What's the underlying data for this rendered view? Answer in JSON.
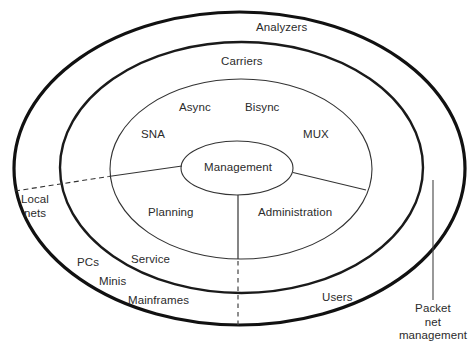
{
  "diagram": {
    "colors": {
      "stroke_outer": "#111111",
      "stroke_inner": "#333333",
      "text": "#2b2b2b",
      "background": "#ffffff"
    },
    "rings": [
      {
        "name": "outer-ring",
        "label": "Analyzers"
      },
      {
        "name": "middle-ring",
        "label": "Carriers"
      },
      {
        "name": "inner-ring",
        "label": ""
      },
      {
        "name": "core",
        "label": "Management"
      }
    ],
    "labels": {
      "analyzers": "Analyzers",
      "carriers": "Carriers",
      "async": "Async",
      "bisync": "Bisync",
      "sna": "SNA",
      "mux": "MUX",
      "management": "Management",
      "planning": "Planning",
      "administration": "Administration",
      "local_nets": "Local\nnets",
      "local_nets_line1": "Local",
      "local_nets_line2": "nets",
      "pcs": "PCs",
      "service": "Service",
      "minis": "Minis",
      "mainframes": "Mainframes",
      "users": "Users",
      "packet_net_management_line1": "Packet",
      "packet_net_management_line2": "net",
      "packet_net_management_line3": "management"
    },
    "geometry": {
      "outer_ellipse": {
        "cx": 239.5,
        "cy": 168.5,
        "rx": 225.5,
        "ry": 156.5,
        "stroke_width": 3.2
      },
      "middle_ellipse": {
        "cx": 241.5,
        "cy": 167.5,
        "rx": 181.5,
        "ry": 125.5,
        "stroke_width": 2.4
      },
      "inner_ellipse": {
        "cx": 241.0,
        "cy": 169.0,
        "rx": 131.0,
        "ry": 90.0,
        "stroke_width": 1.0
      },
      "core_ellipse": {
        "cx": 237.0,
        "cy": 168.0,
        "rx": 56.0,
        "ry": 27.0,
        "stroke_width": 1.0
      }
    }
  }
}
